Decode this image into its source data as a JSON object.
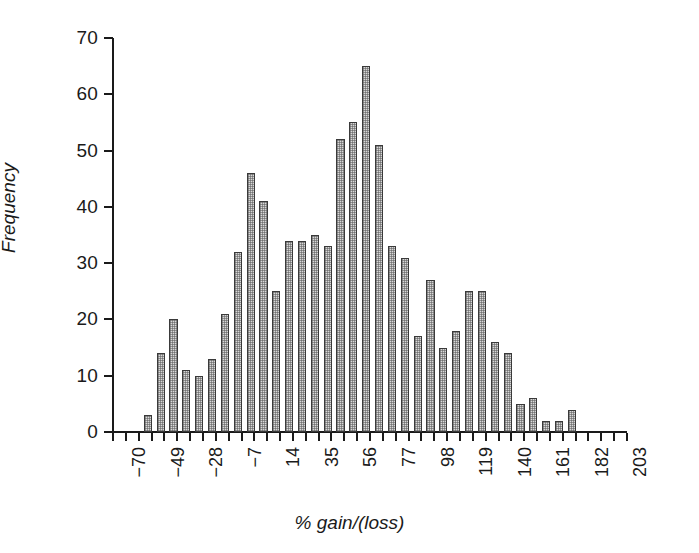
{
  "chart_data": {
    "type": "bar",
    "title": "",
    "subtitle": "",
    "xlabel": "% gain/(loss)",
    "ylabel": "Frequency",
    "ylim": [
      0,
      70
    ],
    "ytick_step": 10,
    "yticks": [
      0,
      10,
      20,
      30,
      40,
      50,
      60,
      70
    ],
    "xtick_labels": [
      "-70",
      "-49",
      "-28",
      "-7",
      "14",
      "35",
      "56",
      "77",
      "98",
      "119",
      "140",
      "161",
      "182",
      "203"
    ],
    "xtick_label_rotation": -90,
    "bin_width": 7,
    "bin_start": -70,
    "grid": false,
    "legend": null,
    "bar_fill_color": "#d8d8d8",
    "bar_edge_color": "#3a3a3a",
    "axis_color": "#1a1a1a",
    "categories": [
      "-70",
      "-63",
      "-56",
      "-49",
      "-42",
      "-35",
      "-28",
      "-21",
      "-14",
      "-7",
      "0",
      "7",
      "14",
      "21",
      "28",
      "35",
      "42",
      "49",
      "56",
      "63",
      "70",
      "77",
      "84",
      "91",
      "98",
      "105",
      "112",
      "119",
      "126",
      "133",
      "140",
      "147",
      "154",
      "161",
      "168",
      "175",
      "182",
      "189",
      "196",
      "203"
    ],
    "values": [
      0,
      0,
      3,
      14,
      20,
      11,
      10,
      13,
      21,
      32,
      46,
      41,
      25,
      34,
      34,
      35,
      33,
      52,
      55,
      65,
      51,
      33,
      31,
      17,
      27,
      15,
      18,
      25,
      25,
      16,
      14,
      5,
      6,
      2,
      2,
      4,
      0,
      0,
      0,
      0
    ]
  },
  "axis": {
    "y_title": "Frequency",
    "x_title": "% gain/(loss)"
  }
}
